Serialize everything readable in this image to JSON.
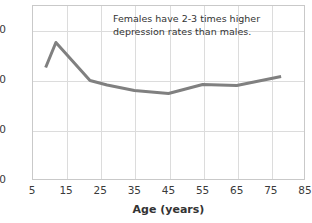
{
  "chart_data": {
    "type": "line",
    "title": "",
    "subtitle": "",
    "xlabel": "Age (years)",
    "ylabel": "",
    "xlim": [
      5,
      85
    ],
    "ylim": [
      0,
      3.4
    ],
    "grid": true,
    "legend": false,
    "legend_position": "none",
    "annotation": "Females have 2-3 times higher depression rates than males.",
    "line_color": "#808080",
    "grid_color": "#dcdcdc",
    "frame_color": "#c9c9c9",
    "background_color": "#ffffff",
    "text_color": "#3a3a3a",
    "x_ticks": [
      5,
      15,
      25,
      35,
      45,
      55,
      65,
      75,
      85
    ],
    "x_tick_labels": [
      "5",
      "15",
      "25",
      "35",
      "45",
      "55",
      "65",
      "75",
      "85"
    ],
    "y_ticks": [
      0,
      1.0,
      2.0,
      3.0
    ],
    "y_tick_labels": [
      "0",
      "1.0",
      "2.0",
      "3.0"
    ],
    "series": [
      {
        "name": "Depression rate",
        "x": [
          9,
          12,
          22,
          27,
          35,
          45,
          55,
          65,
          78
        ],
        "values": [
          2.25,
          2.75,
          1.99,
          1.9,
          1.79,
          1.73,
          1.91,
          1.89,
          2.07
        ]
      }
    ]
  }
}
